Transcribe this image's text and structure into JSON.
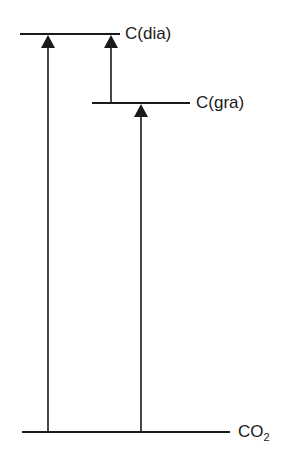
{
  "diagram": {
    "type": "energy-level-diagram",
    "levels": [
      {
        "id": "diamond",
        "label": "C(dia)",
        "y": 34,
        "x1": 20,
        "x2": 120
      },
      {
        "id": "graphite",
        "label": "C(gra)",
        "y": 103,
        "x1": 92,
        "x2": 190
      },
      {
        "id": "co2",
        "label_main": "CO",
        "label_sub": "2",
        "y": 432,
        "x1": 22,
        "x2": 230
      }
    ],
    "arrows": [
      {
        "id": "co2-to-diamond",
        "x": 48,
        "from_y": 432,
        "to_y": 34
      },
      {
        "id": "graphite-to-diamond",
        "x": 111,
        "from_y": 103,
        "to_y": 34
      },
      {
        "id": "co2-to-graphite",
        "x": 141,
        "from_y": 432,
        "to_y": 103
      }
    ],
    "colors": {
      "line": "#1a1a1a",
      "background": "#ffffff"
    }
  }
}
